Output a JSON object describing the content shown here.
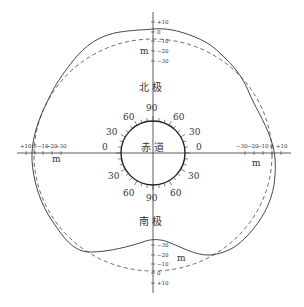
{
  "figure": {
    "labels": {
      "north_pole": "北 极",
      "south_pole": "南 极",
      "equator": "赤 道",
      "unit": "m"
    },
    "top_scale": {
      "ticks": [
        "+10",
        "0",
        "−10",
        "−20",
        "−30"
      ]
    },
    "bottom_scale": {
      "ticks": [
        "−30",
        "−20",
        "−10",
        "0",
        "+10"
      ]
    },
    "left_scale": {
      "ticks": [
        "+10",
        "0",
        "−10",
        "−20",
        "−30"
      ]
    },
    "right_scale": {
      "ticks": [
        "−30",
        "−20",
        "−10",
        "0",
        "+10"
      ]
    },
    "latitude_labels": {
      "upper": [
        "0",
        "30",
        "60",
        "90",
        "60",
        "30",
        "0"
      ],
      "lower": [
        "30",
        "60",
        "90",
        "60",
        "30"
      ]
    },
    "curves": {
      "geoid": {
        "style": "solid",
        "color": "#333333"
      },
      "reference_ellipse": {
        "style": "dashed",
        "color": "#333333"
      }
    },
    "deviations_m": {
      "north_pole": 0,
      "south_pole": -30,
      "equator_left": 0,
      "equator_right": 0
    }
  }
}
